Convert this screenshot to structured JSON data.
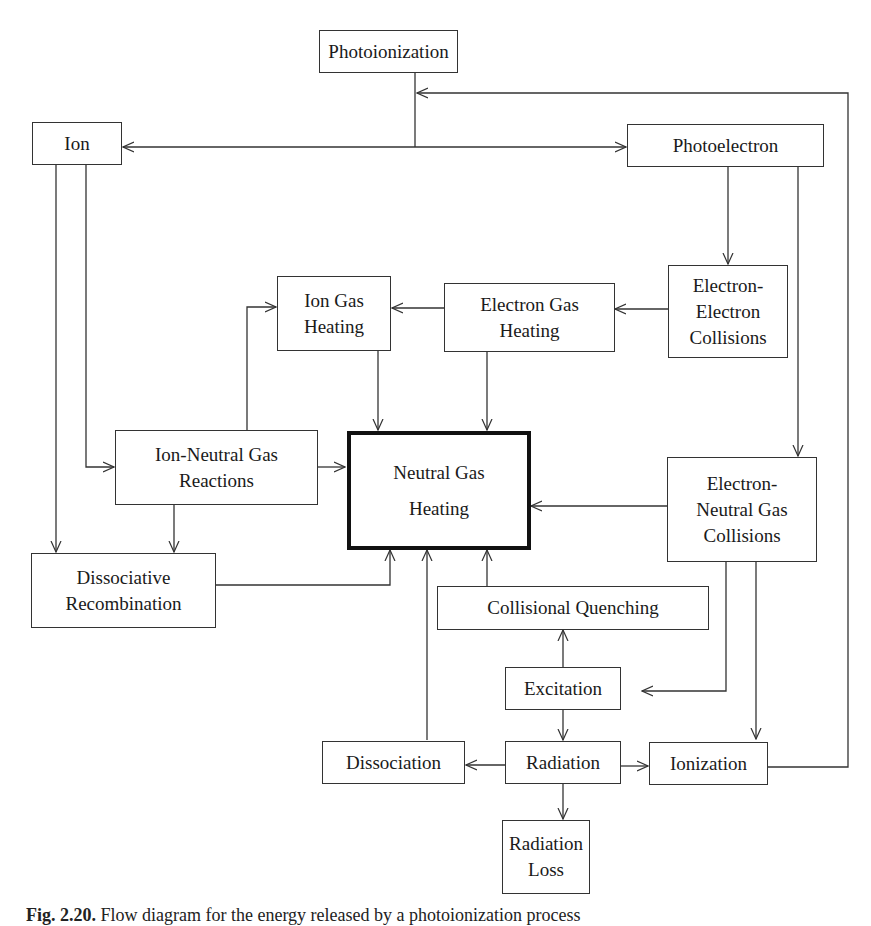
{
  "figure": {
    "caption_label": "Fig. 2.20.",
    "caption_text": "Flow diagram for the energy released by a photoionization process"
  },
  "nodes": {
    "photoionization": "Photoionization",
    "ion": "Ion",
    "photoelectron": "Photoelectron",
    "ion_gas_heating": "Ion Gas\nHeating",
    "electron_gas_heating": "Electron Gas\nHeating",
    "electron_electron_collisions": "Electron-\nElectron\nCollisions",
    "ion_neutral_gas_reactions": "Ion-Neutral Gas\nReactions",
    "neutral_gas_heating": "Neutral Gas\nHeating",
    "electron_neutral_gas_collisions": "Electron-\nNeutral Gas\nCollisions",
    "dissociative_recombination": "Dissociative\nRecombination",
    "collisional_quenching": "Collisional Quenching",
    "excitation": "Excitation",
    "dissociation": "Dissociation",
    "radiation": "Radiation",
    "ionization": "Ionization",
    "radiation_loss": "Radiation\nLoss"
  },
  "edges": [
    {
      "from": "Photoionization",
      "to": "Ion"
    },
    {
      "from": "Photoionization",
      "to": "Photoelectron"
    },
    {
      "from": "Ion",
      "to": "Ion-Neutral Gas Reactions"
    },
    {
      "from": "Ion",
      "to": "Dissociative Recombination"
    },
    {
      "from": "Photoelectron",
      "to": "Electron-Electron Collisions"
    },
    {
      "from": "Photoelectron",
      "to": "Electron-Neutral Gas Collisions"
    },
    {
      "from": "Electron-Electron Collisions",
      "to": "Electron Gas Heating"
    },
    {
      "from": "Electron Gas Heating",
      "to": "Ion Gas Heating"
    },
    {
      "from": "Electron Gas Heating",
      "to": "Neutral Gas Heating"
    },
    {
      "from": "Ion Gas Heating",
      "to": "Neutral Gas Heating"
    },
    {
      "from": "Ion-Neutral Gas Reactions",
      "to": "Ion Gas Heating"
    },
    {
      "from": "Ion-Neutral Gas Reactions",
      "to": "Neutral Gas Heating"
    },
    {
      "from": "Ion-Neutral Gas Reactions",
      "to": "Dissociative Recombination"
    },
    {
      "from": "Dissociative Recombination",
      "to": "Neutral Gas Heating"
    },
    {
      "from": "Electron-Neutral Gas Collisions",
      "to": "Neutral Gas Heating"
    },
    {
      "from": "Electron-Neutral Gas Collisions",
      "to": "Excitation"
    },
    {
      "from": "Electron-Neutral Gas Collisions",
      "to": "Ionization"
    },
    {
      "from": "Collisional Quenching",
      "to": "Neutral Gas Heating"
    },
    {
      "from": "Excitation",
      "to": "Collisional Quenching"
    },
    {
      "from": "Excitation",
      "to": "Radiation"
    },
    {
      "from": "Dissociation",
      "to": "Neutral Gas Heating"
    },
    {
      "from": "Radiation",
      "to": "Dissociation"
    },
    {
      "from": "Radiation",
      "to": "Ionization"
    },
    {
      "from": "Radiation",
      "to": "Radiation Loss"
    },
    {
      "from": "Ionization",
      "to": "Photoionization"
    }
  ]
}
